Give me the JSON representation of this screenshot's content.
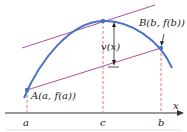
{
  "diagram": {
    "axis_label": "x",
    "ticks": [
      {
        "label": "a",
        "x": 27
      },
      {
        "label": "c",
        "x": 103
      },
      {
        "label": "b",
        "x": 161
      }
    ],
    "points": {
      "A": {
        "label": "A(a, f(a))"
      },
      "B": {
        "label": "B(b, f(b))"
      }
    },
    "distance_label": "v(x)",
    "colors": {
      "curve": "#4a72c4",
      "secant": "#b0509a",
      "tangent": "#b0509a",
      "dashed": "#e06a5a",
      "axis": "#333333",
      "point": "#4a72c4"
    }
  }
}
